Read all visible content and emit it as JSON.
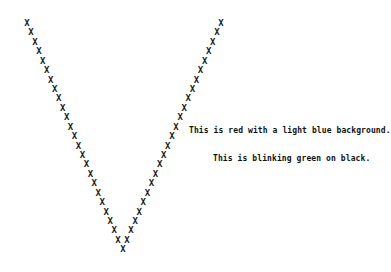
{
  "v_pattern": {
    "glyph": "X",
    "left_arm": {
      "start": [
        27,
        24
      ],
      "step": [
        3.96,
        9.43
      ],
      "count": 24
    },
    "right_arm": {
      "start": [
        221,
        24
      ],
      "step": [
        -4.09,
        9.43
      ],
      "count": 24
    },
    "vertex": [
      123,
      250
    ]
  },
  "text_lines": [
    {
      "text": "This is red with a light blue background."
    },
    {
      "text": "This is blinking green on black."
    }
  ]
}
